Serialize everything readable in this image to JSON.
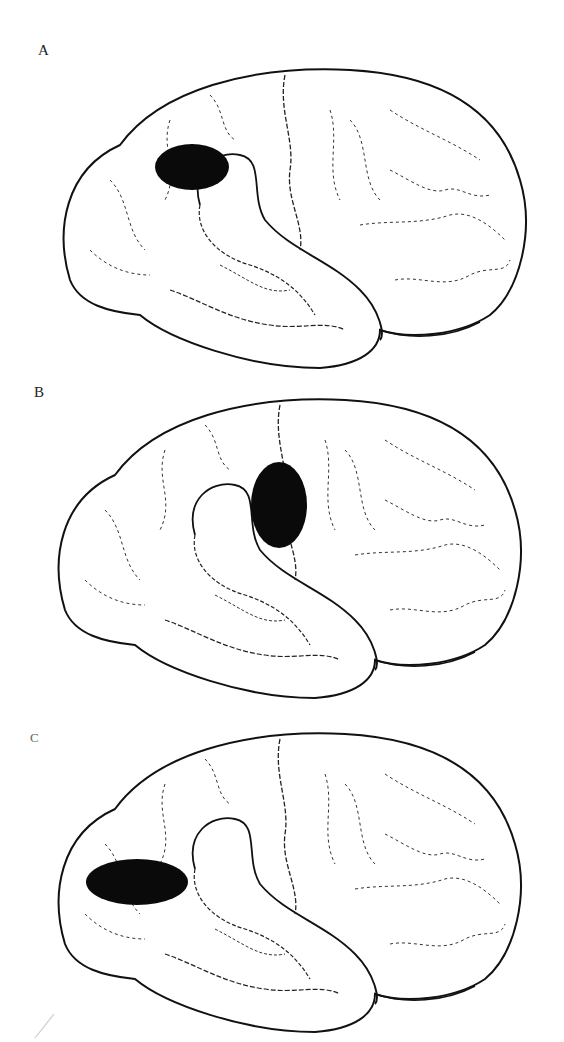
{
  "figure": {
    "colors": {
      "background": "#ffffff",
      "outline": "#111111",
      "sulci": "#333333",
      "marker": "#0a0a0a"
    },
    "panels": [
      {
        "label": "A",
        "marker": {
          "cx": 192,
          "cy": 167,
          "rx": 37,
          "ry": 23
        }
      },
      {
        "label": "B",
        "marker": {
          "cx": 279,
          "cy": 505,
          "rx": 28,
          "ry": 43
        }
      },
      {
        "label": "C",
        "marker": {
          "cx": 137,
          "cy": 882,
          "rx": 51,
          "ry": 23
        }
      }
    ]
  }
}
